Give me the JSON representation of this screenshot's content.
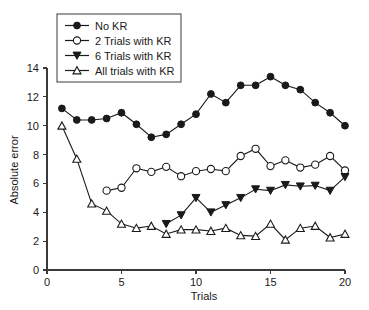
{
  "chart_data": {
    "type": "line",
    "title": "",
    "xlabel": "Trials",
    "ylabel": "Absolute error",
    "xlim": [
      0,
      20
    ],
    "ylim": [
      0,
      14
    ],
    "xticks": [
      0,
      5,
      10,
      15,
      20
    ],
    "yticks": [
      0,
      2,
      4,
      6,
      8,
      10,
      12,
      14
    ],
    "xtick_labels": [
      "0",
      "5",
      "10",
      "15",
      "20"
    ],
    "ytick_labels": [
      "0",
      "2",
      "4",
      "6",
      "8",
      "10",
      "12",
      "14"
    ],
    "grid": false,
    "legend_position": "top-left",
    "series": [
      {
        "name": "No KR",
        "marker": "filled-circle",
        "x": [
          1,
          2,
          3,
          4,
          5,
          6,
          7,
          8,
          9,
          10,
          11,
          12,
          13,
          14,
          15,
          16,
          17,
          18,
          19,
          20
        ],
        "values": [
          11.2,
          10.4,
          10.4,
          10.5,
          10.9,
          10.1,
          9.2,
          9.4,
          10.1,
          10.8,
          12.2,
          11.6,
          12.8,
          12.8,
          13.4,
          12.8,
          12.5,
          11.6,
          10.9,
          10.0
        ]
      },
      {
        "name": "2 Trials with KR",
        "marker": "open-circle",
        "x": [
          4,
          5,
          6,
          7,
          8,
          9,
          10,
          11,
          12,
          13,
          14,
          15,
          16,
          17,
          18,
          19,
          20
        ],
        "values": [
          5.5,
          5.7,
          7.05,
          6.8,
          7.15,
          6.5,
          6.85,
          7.0,
          6.85,
          7.9,
          8.4,
          7.2,
          7.6,
          7.1,
          7.3,
          7.9,
          6.9
        ]
      },
      {
        "name": "6 Trials with KR",
        "marker": "filled-triangle-down",
        "x": [
          8,
          9,
          10,
          11,
          12,
          13,
          14,
          15,
          16,
          17,
          18,
          19,
          20
        ],
        "values": [
          3.2,
          3.8,
          5.0,
          4.0,
          4.5,
          5.0,
          5.6,
          5.5,
          5.9,
          5.8,
          5.85,
          5.5,
          6.45
        ]
      },
      {
        "name": "All trials with KR",
        "marker": "open-triangle-up",
        "x": [
          1,
          2,
          3,
          4,
          5,
          6,
          7,
          8,
          9,
          10,
          11,
          12,
          13,
          14,
          15,
          16,
          17,
          18,
          19,
          20
        ],
        "values": [
          10.0,
          7.7,
          4.6,
          4.1,
          3.2,
          2.9,
          3.05,
          2.5,
          2.8,
          2.8,
          2.7,
          2.9,
          2.4,
          2.35,
          3.2,
          2.1,
          2.9,
          3.05,
          2.25,
          2.5
        ]
      }
    ]
  },
  "legend": {
    "entries": [
      {
        "label": "No KR"
      },
      {
        "label": "2 Trials with KR"
      },
      {
        "label": "6 Trials with KR"
      },
      {
        "label": "All trials with KR"
      }
    ]
  },
  "colors": {
    "ink": "#1a1a1a",
    "axis": "#3a3a3a",
    "background": "#ffffff"
  }
}
